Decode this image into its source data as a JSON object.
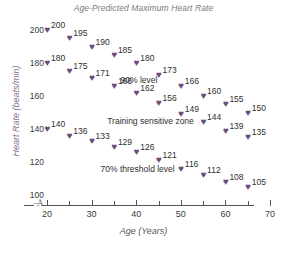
{
  "chart_data": {
    "type": "scatter",
    "title": "Age-Predicted Maximum Heart Rate",
    "xlabel": "Age (Years)",
    "ylabel": "Heart Rate (beats/min)",
    "xlim": [
      17,
      71
    ],
    "ylim": [
      95,
      208
    ],
    "grid": false,
    "legend": "none",
    "marker": "heart",
    "marker_color": "#6b4d7d",
    "axis_break": true,
    "x_ticks": [
      20,
      30,
      40,
      50,
      60,
      70
    ],
    "x_minor_ticks": [
      25,
      35,
      45,
      55,
      65
    ],
    "y_ticks": [
      100,
      120,
      140,
      160,
      180,
      200
    ],
    "x": [
      20,
      25,
      30,
      35,
      40,
      45,
      50,
      55,
      60,
      65
    ],
    "series": [
      {
        "name": "Age-predicted maximum heart rate",
        "values": [
          200,
          195,
          190,
          185,
          180,
          173,
          166,
          160,
          155,
          150
        ]
      },
      {
        "name": "90% level",
        "values": [
          180,
          175,
          171,
          166,
          162,
          156,
          149,
          144,
          139,
          135
        ]
      },
      {
        "name": "70% threshold level",
        "values": [
          140,
          136,
          133,
          129,
          126,
          121,
          116,
          112,
          108,
          105
        ]
      }
    ],
    "annotations": [
      {
        "text": "90% level",
        "x": 36.5,
        "y": 170
      },
      {
        "text": "Training sensitive zone",
        "x": 33.5,
        "y": 145
      },
      {
        "text": "70% threshold level",
        "x": 32.0,
        "y": 116
      }
    ]
  },
  "axis": {
    "y_tick_labels": [
      "200",
      "180",
      "160",
      "140",
      "120",
      "100"
    ],
    "x_tick_labels": [
      "20",
      "30",
      "40",
      "50",
      "60",
      "70"
    ]
  },
  "point_labels": {
    "s0": [
      "200",
      "195",
      "190",
      "185",
      "180",
      "173",
      "166",
      "160",
      "155",
      "150"
    ],
    "s1": [
      "180",
      "175",
      "171",
      "166",
      "162",
      "156",
      "149",
      "144",
      "139",
      "135"
    ],
    "s2": [
      "140",
      "136",
      "133",
      "129",
      "126",
      "121",
      "116",
      "112",
      "108",
      "105"
    ]
  },
  "marker_glyph": "♥",
  "break_glyph": "≈"
}
